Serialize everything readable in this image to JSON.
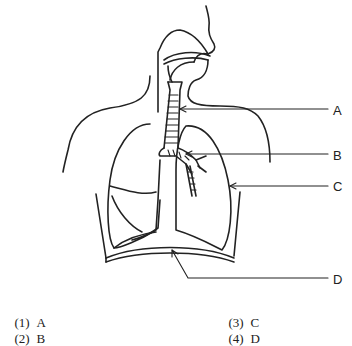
{
  "diagram": {
    "labels": [
      {
        "id": "A",
        "text": "A",
        "y": 110
      },
      {
        "id": "B",
        "text": "B",
        "y": 155
      },
      {
        "id": "C",
        "text": "C",
        "y": 186
      },
      {
        "id": "D",
        "text": "D",
        "y": 280
      }
    ],
    "stroke_color": "#222222",
    "background": "#ffffff"
  },
  "choices": [
    {
      "number": "(1)",
      "answer": "A"
    },
    {
      "number": "(2)",
      "answer": "B"
    },
    {
      "number": "(3)",
      "answer": "C"
    },
    {
      "number": "(4)",
      "answer": "D"
    }
  ]
}
